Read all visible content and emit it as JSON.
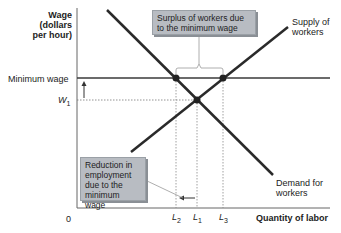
{
  "diagram": {
    "y_axis_label": [
      "Wage",
      "(dollars",
      "per hour)"
    ],
    "x_axis_label": "Quantity of labor",
    "origin_label": "0",
    "y_ticks": {
      "minimum_wage": "Minimum wage",
      "w1": "W",
      "w1_sub": "1"
    },
    "x_ticks": [
      {
        "main": "L",
        "sub": "2"
      },
      {
        "main": "L",
        "sub": "1"
      },
      {
        "main": "L",
        "sub": "3"
      }
    ],
    "curves": {
      "supply": [
        "Supply of",
        "workers"
      ],
      "demand": [
        "Demand for",
        "workers"
      ]
    },
    "callouts": {
      "surplus": [
        "Surplus of workers due",
        "to the minimum wage"
      ],
      "reduction": [
        "Reduction in",
        "employment",
        "due to the",
        "minimum wage"
      ]
    },
    "colors": {
      "curve": "#2a2a2a",
      "box": "#b8bcc2",
      "axis": "#555555"
    }
  }
}
